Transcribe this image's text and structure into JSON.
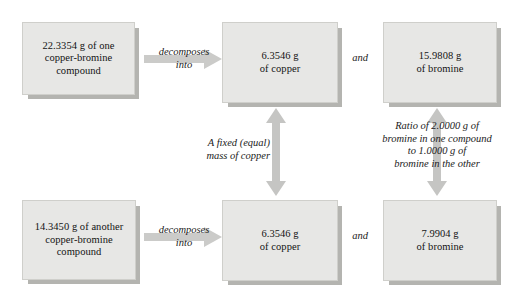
{
  "diagram": {
    "colors": {
      "box_fill": "#e7e7e5",
      "box_border": "#cfcfcb",
      "box_shadow": "#b4b4b0",
      "arrow_fill": "#c9c9c7",
      "text": "#131313",
      "background": "#ffffff"
    },
    "boxes": {
      "top_left": "22.3354 g of one\ncopper-bromine\ncompound",
      "top_middle": "6.3546 g\nof copper",
      "top_right": "15.9808 g\nof bromine",
      "bottom_left": "14.3450 g of another\ncopper-bromine\ncompound",
      "bottom_middle": "6.3546 g\nof copper",
      "bottom_right": "7.9904 g\nof bromine"
    },
    "labels": {
      "decomposes_top": "decomposes\ninto",
      "decomposes_bottom": "decomposes\ninto",
      "and_top": "and",
      "and_bottom": "and",
      "fixed_mass": "A fixed (equal)\nmass of copper",
      "ratio": "Ratio of 2.0000 g of\nbromine in one compound\nto 1.0000 g of\nbromine in the other"
    },
    "icons": {
      "horizontal_arrow": "arrow-right-icon",
      "vertical_arrow": "arrow-up-down-icon"
    }
  }
}
